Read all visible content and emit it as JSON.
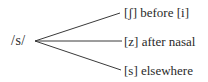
{
  "diagram": {
    "type": "phonological-rule-tree",
    "root": {
      "label": "/s/"
    },
    "branches": [
      {
        "label": "[ʃ] before [i]",
        "allophone": "[ʃ]",
        "environment": "before [i]"
      },
      {
        "label": "[z] after nasal",
        "allophone": "[z]",
        "environment": "after nasal"
      },
      {
        "label": "[s] elsewhere",
        "allophone": "[s]",
        "environment": "elsewhere"
      }
    ],
    "colors": {
      "text": "#2a2a2a",
      "line": "#3a3a3a",
      "background": "#ffffff"
    }
  }
}
